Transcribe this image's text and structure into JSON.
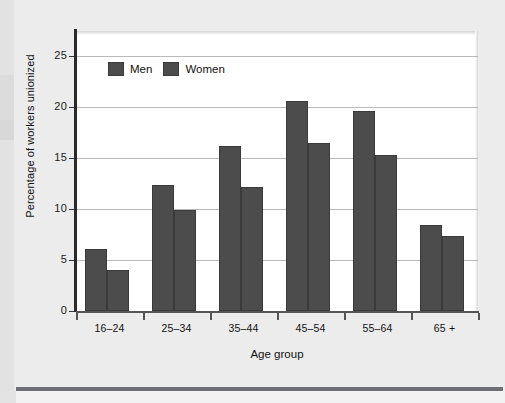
{
  "chart_data": {
    "type": "bar",
    "title": "",
    "xlabel": "Age group",
    "ylabel": "Percentage of workers unionized",
    "categories": [
      "16–24",
      "25–34",
      "35–44",
      "45–54",
      "55–64",
      "65 +"
    ],
    "series": [
      {
        "name": "Men",
        "values": [
          6.1,
          12.4,
          16.2,
          20.6,
          19.6,
          8.4
        ]
      },
      {
        "name": "Women",
        "values": [
          4.0,
          9.9,
          12.2,
          16.5,
          15.3,
          7.4
        ]
      }
    ],
    "ylim": [
      0,
      27.5
    ],
    "yticks": [
      0,
      5,
      10,
      15,
      20,
      25
    ],
    "ytick_labels": [
      "0",
      "5",
      "10",
      "15",
      "20",
      "25"
    ],
    "grid": true,
    "legend_position": "top-left",
    "bar_color": "#4c4c4c",
    "plot_background": "#ffffff",
    "page_background": "#ececec"
  },
  "legend": {
    "items": [
      {
        "label": "Men"
      },
      {
        "label": "Women"
      }
    ]
  }
}
